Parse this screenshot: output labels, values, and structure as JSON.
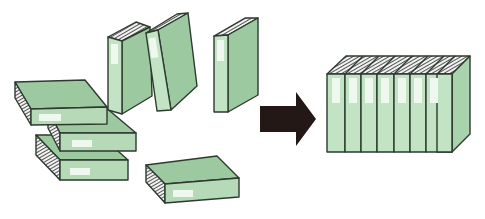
{
  "diagram": {
    "description": "Scattered binders being organized into an aligned row of binders",
    "left_group": {
      "label": "scattered-binders",
      "upright_count": 3,
      "flat_count": 4
    },
    "arrow": {
      "direction": "right",
      "color": "#231815"
    },
    "right_group": {
      "label": "organized-binders",
      "binder_count": 7
    },
    "colors": {
      "cover_top": "#9cc99f",
      "cover_side": "#a9d3ac",
      "spine": "#c3e3c5",
      "spine_label": "#eef8ef",
      "outline": "#2d3a2e",
      "pages": "#f2f2f2",
      "page_lines": "#555555",
      "background": "#ffffff"
    }
  }
}
